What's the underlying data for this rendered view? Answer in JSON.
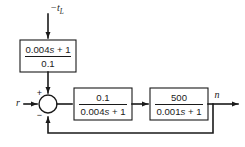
{
  "diagram": {
    "type": "control-system-block-diagram",
    "background_color": "#ffffff",
    "line_color": "#1a1a1a",
    "signals": {
      "disturbance_input": "−t",
      "disturbance_input_subscript": "L",
      "reference_input": "r",
      "output": "n"
    },
    "summing_junction": {
      "name": "summing-junction",
      "reference_sign": "+",
      "feedback_sign": "−",
      "disturbance_sign": ""
    },
    "blocks": [
      {
        "id": "disturbance-block",
        "numerator_prefix": "0.004",
        "numerator_var": "s",
        "numerator_suffix": " + 1",
        "numerator": "0.004s + 1",
        "denominator": "0.1",
        "x": 20,
        "y": 40,
        "width": 56,
        "height": 32
      },
      {
        "id": "forward-block-1",
        "numerator": "0.1",
        "denominator_prefix": "0.004",
        "denominator_var": "s",
        "denominator_suffix": " + 1",
        "denominator": "0.004s + 1",
        "x": 74,
        "y": 88,
        "width": 58,
        "height": 32
      },
      {
        "id": "forward-block-2",
        "numerator": "500",
        "denominator_prefix": "0.001",
        "denominator_var": "s",
        "denominator_suffix": " + 1",
        "denominator": "0.001s + 1",
        "x": 150,
        "y": 88,
        "width": 58,
        "height": 32
      }
    ],
    "feedback": {
      "label": "unity-feedback",
      "tap_x": 213,
      "bottom_y": 133
    }
  }
}
